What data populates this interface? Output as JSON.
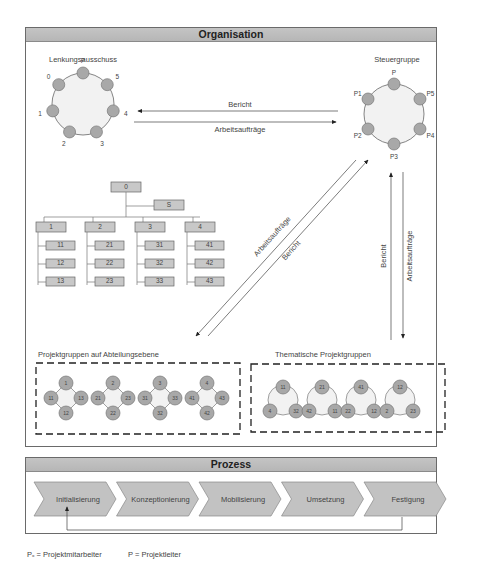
{
  "organisation": {
    "title": "Organisation",
    "lenkungsausschuss": {
      "label": "Lenkungsausschuss",
      "members": [
        "P",
        "5",
        "4",
        "3",
        "2",
        "1",
        "0"
      ]
    },
    "steuergruppe": {
      "label": "Steuergruppe",
      "members": [
        "P",
        "P5",
        "P4",
        "P3",
        "P2",
        "P1"
      ]
    },
    "horizontal_arrows": {
      "top_label": "Bericht",
      "bottom_label": "Arbeitsaufträge"
    },
    "diagonal_arrows": {
      "upper_label": "Arbeitsaufträge",
      "lower_label": "Bericht"
    },
    "vertical_arrows": {
      "left_label": "Bericht",
      "right_label": "Arbeitsaufträge"
    },
    "org_chart": {
      "root": "0",
      "staff": "S",
      "departments": [
        {
          "label": "1",
          "units": [
            "11",
            "12",
            "13"
          ]
        },
        {
          "label": "2",
          "units": [
            "21",
            "22",
            "23"
          ]
        },
        {
          "label": "3",
          "units": [
            "31",
            "32",
            "33"
          ]
        },
        {
          "label": "4",
          "units": [
            "41",
            "42",
            "43"
          ]
        }
      ]
    },
    "abteilungsgruppen": {
      "label": "Projektgruppen auf Abteilungsebene",
      "groups": [
        {
          "top": "1",
          "left": "11",
          "right": "13",
          "bottom": "12"
        },
        {
          "top": "2",
          "left": "21",
          "right": "23",
          "bottom": "22"
        },
        {
          "top": "3",
          "left": "31",
          "right": "33",
          "bottom": "32"
        },
        {
          "top": "4",
          "left": "41",
          "right": "43",
          "bottom": "42"
        }
      ]
    },
    "thematische_gruppen": {
      "label": "Thematische Projektgruppen",
      "groups": [
        {
          "top": "11",
          "left": "4",
          "right": "32"
        },
        {
          "top": "21",
          "left": "42",
          "right": "11"
        },
        {
          "top": "41",
          "left": "22",
          "right": "12"
        },
        {
          "top": "12",
          "left": "2",
          "right": "23"
        }
      ]
    }
  },
  "prozess": {
    "title": "Prozess",
    "phases": [
      "Initialisierung",
      "Konzeptionierung",
      "Mobilisierung",
      "Umsetzung",
      "Festigung"
    ]
  },
  "legend": {
    "px": "Pₓ = Projektmitarbeiter",
    "p": "P = Projektleiter"
  },
  "colors": {
    "header_bg": "#bababa",
    "node_fill": "#a8a8a8",
    "box_fill": "#c8c8c8",
    "ring_fill": "#f2f2f2"
  }
}
